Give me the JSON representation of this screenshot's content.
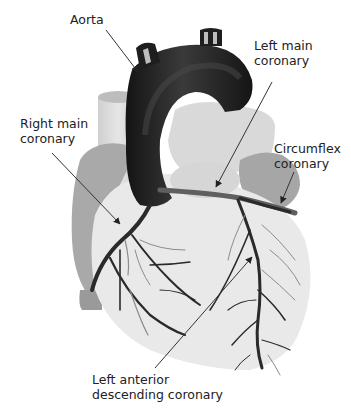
{
  "diagram": {
    "labels": {
      "aorta": {
        "lines": [
          "Aorta"
        ]
      },
      "left_main": {
        "lines": [
          "Left main",
          "coronary"
        ]
      },
      "right_main": {
        "lines": [
          "Right main",
          "coronary"
        ]
      },
      "circumflex": {
        "lines": [
          "Circumflex",
          "coronary"
        ]
      },
      "lad": {
        "lines": [
          "Left anterior",
          "descending coronary"
        ]
      }
    },
    "colors": {
      "aorta": "#1e1e1e",
      "heart_body": "#e8e8e8",
      "atrium": "#a8a8a8",
      "vessel_back": "#d4d4d4",
      "artery": "#2a2a2a",
      "artery_faint": "#8c8c8c",
      "label_text": "#222222",
      "leader_line": "#333333"
    }
  }
}
